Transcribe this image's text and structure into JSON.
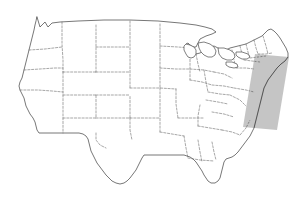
{
  "figure": {
    "background_color": "#ffffff",
    "width": 296,
    "height": 201
  },
  "style": {
    "coastline_color": "#4a4a4a",
    "state_border_color": "#6b6b6b",
    "highlight_fill": "#bdbdbd",
    "land_fill": "#ffffff"
  },
  "highlight": {
    "name": "northeast-corridor-highlight",
    "shape": "parallelogram",
    "fill_color": "#bdbdbd",
    "corners": [
      [
        255,
        54
      ],
      [
        289,
        57
      ],
      [
        277,
        130
      ],
      [
        243,
        127
      ]
    ]
  },
  "regions": {
    "coastline_outline": "M 37,17 L 40,27 L 45,22 L 48,27 L 52,23 L 60,22 L 78,21 L 104,20 L 130,20 L 158,21 L 180,23 L 196,25 L 205,27 L 212,29 L 216,32 L 212,34 L 206,36 L 200,39 L 198,43 L 196,47 L 193,47 L 190,45 L 188,43 L 186,44 L 188,48 L 192,52 L 196,54 L 200,53 L 205,50 L 210,47 L 214,46 L 218,48 L 222,50 L 226,50 L 230,48 L 234,47 L 238,46 L 242,45 L 246,44 L 250,42 L 254,40 L 258,38 L 262,36 L 265,33 L 268,30 L 271,29 L 274,31 L 277,34 L 280,38 L 283,43 L 286,48 L 288,53 L 288,57 L 285,61 L 281,64 L 277,68 L 274,72 L 271,76 L 268,80 L 266,84 L 264,88 L 263,92 L 262,96 L 261,100 L 260,104 L 259,108 L 258,112 L 257,116 L 256,120 L 255,124 L 254,128 L 252,132 L 250,136 L 247,140 L 244,144 L 241,148 L 238,152 L 235,155 L 232,157 L 229,158 L 226,159 L 224,162 L 223,166 L 222,170 L 221,174 L 220,178 L 218,181 L 215,183 L 211,183 L 208,181 L 206,178 L 204,175 L 202,171 L 200,168 L 198,165 L 196,162 L 193,159 L 190,157 L 187,156 L 184,155 L 180,155 L 176,155 L 172,155 L 168,155 L 164,155 L 160,155 L 156,155 L 152,155 L 148,155 L 144,155 L 142,158 L 140,162 L 138,166 L 136,170 L 133,174 L 130,178 L 127,181 L 124,183 L 120,184 L 116,183 L 112,181 L 109,178 L 106,175 L 103,171 L 100,167 L 97,163 L 95,159 L 93,155 L 91,151 L 90,147 L 89,143 L 88,139 L 86,136 L 83,134 L 79,133 L 75,133 L 71,133 L 67,133 L 63,133 L 59,133 L 55,133 L 51,133 L 47,133 L 43,133 L 39,133 L 37,130 L 36,126 L 35,122 L 33,118 L 30,114 L 28,110 L 26,106 L 25,102 L 24,98 L 22,94 L 20,90 L 19,86 L 20,82 L 22,78 L 23,74 L 24,70 L 25,66 L 26,62 L 27,58 L 28,54 L 29,50 L 30,46 L 31,42 L 32,38 L 33,34 L 34,30 L 35,25 L 36,21 Z",
    "state_borders": [
      "M 62,22 L 62,44 L 63,60 L 63,72",
      "M 29,50 L 45,49 L 62,47 L 63,47",
      "M 24,70 L 40,69 L 55,68 L 63,68",
      "M 63,72 L 78,72 L 92,72 L 96,72",
      "M 96,25 L 96,47 L 96,70 L 96,72",
      "M 96,47 L 118,47 L 130,47",
      "M 130,21 L 130,47 L 130,70 L 130,88",
      "M 96,72 L 112,72 L 130,72",
      "M 96,95 L 116,95 L 130,95",
      "M 63,72 L 63,95 L 63,118 L 63,133",
      "M 20,90 L 38,90 L 52,91 L 63,92",
      "M 63,95 L 80,95 L 96,95",
      "M 63,118 L 80,118 L 96,118 L 96,95",
      "M 96,118 L 112,118 L 130,118 L 130,95",
      "M 130,118 L 148,118 L 160,118",
      "M 160,24 L 160,46 L 160,68 L 160,88",
      "M 130,88 L 146,88 L 160,88 L 176,89",
      "M 160,46 L 178,47 L 190,48",
      "M 160,68 L 176,69 L 190,69",
      "M 96,133 L 96,140 L 100,145 L 106,148",
      "M 130,118 L 130,130 L 132,140",
      "M 160,88 L 160,104 L 160,118 L 160,132",
      "M 176,89 L 176,104 L 178,118",
      "M 178,118 L 192,118 L 204,118",
      "M 190,48 L 190,66 L 190,80",
      "M 190,69 L 204,70 L 214,72",
      "M 190,80 L 202,82 L 212,85",
      "M 196,54 L 198,64 L 200,72",
      "M 204,70 L 206,82 L 208,92",
      "M 208,92 L 220,94 L 230,95",
      "M 214,72 L 224,74 L 232,78",
      "M 212,85 L 224,86 L 234,88",
      "M 206,100 L 218,102 L 228,104",
      "M 200,105 L 198,116 L 198,126",
      "M 198,126 L 210,128 L 222,130",
      "M 212,112 L 224,114 L 234,117",
      "M 222,130 L 232,132 L 240,135",
      "M 160,132 L 172,134 L 184,136",
      "M 184,136 L 186,148 L 188,158",
      "M 198,140 L 200,152 L 202,162",
      "M 212,142 L 214,152 L 216,160",
      "M 188,158 L 200,160 L 214,161",
      "M 230,95 L 240,100 L 246,106",
      "M 234,88 L 246,90 L 254,92",
      "M 246,44 L 248,52 L 250,58",
      "M 254,40 L 256,48 L 258,54",
      "M 240,46 L 242,54 L 244,60",
      "M 250,58 L 258,57 L 266,56",
      "M 244,60 L 252,61 L 260,62",
      "M 258,54 L 266,54 L 272,53",
      "M 263,36 L 266,46 L 268,54",
      "M 232,50 L 234,60 L 236,68",
      "M 236,68 L 246,68 L 254,69",
      "M 240,135 L 246,128 L 250,120"
    ],
    "great_lakes": [
      "M 186,44 L 190,45 L 194,47 L 196,50 L 196,54 L 194,57 L 191,58 L 188,57 L 186,54 L 184,50 L 184,46 Z",
      "M 198,43 L 204,42 L 210,44 L 214,47 L 216,51 L 215,55 L 212,57 L 208,57 L 204,55 L 201,52 L 199,48 Z",
      "M 218,48 L 224,48 L 230,50 L 234,53 L 235,57 L 232,60 L 227,60 L 222,58 L 219,54 Z",
      "M 236,52 L 242,52 L 248,54 L 250,57 L 247,59 L 242,59 L 238,57 L 236,55 Z",
      "M 226,62 L 232,62 L 237,64 L 238,67 L 234,68 L 229,67 L 226,65 Z"
    ]
  },
  "labels": {
    "visible_text": []
  }
}
